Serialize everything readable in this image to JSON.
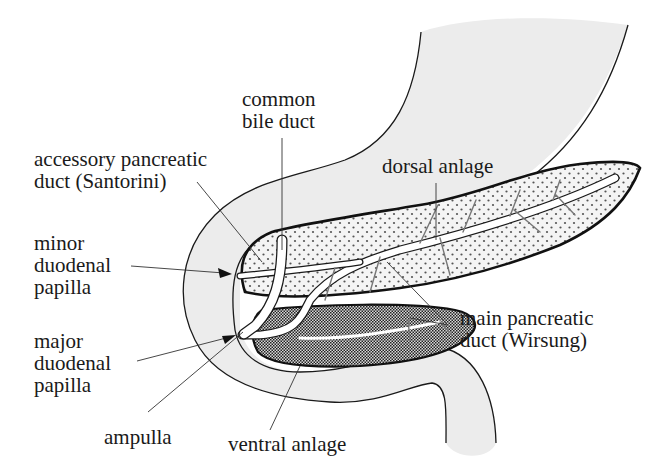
{
  "diagram": {
    "type": "anatomical-line-drawing",
    "colors": {
      "background": "#ffffff",
      "duodenum_fill": "#ececec",
      "dorsal_fill": "#f4f4f4",
      "dorsal_dots": "#555555",
      "ventral_fill": "#b5b5b5",
      "ventral_dots": "#222222",
      "duct_fill": "#ffffff",
      "outline": "#1a1a1a"
    },
    "labels": {
      "common_bile_duct": [
        "common",
        "bile duct"
      ],
      "accessory_duct": [
        "accessory pancreatic",
        "duct (Santorini)"
      ],
      "dorsal_anlage": [
        "dorsal anlage"
      ],
      "minor_papilla": [
        "minor",
        "duodenal",
        "papilla"
      ],
      "major_papilla": [
        "major",
        "duodenal",
        "papilla"
      ],
      "main_duct": [
        "main pancreatic",
        "duct (Wirsung)"
      ],
      "ampulla": [
        "ampulla"
      ],
      "ventral_anlage": [
        "ventral anlage"
      ]
    }
  }
}
